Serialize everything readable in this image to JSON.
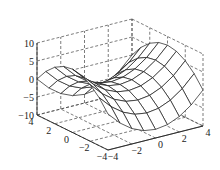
{
  "chart_data": {
    "type": "surface",
    "title": "",
    "xlabel": "",
    "ylabel": "",
    "zlabel": "",
    "function": "z = (x^2 - y^2) / 2",
    "x_range": [
      -4,
      4
    ],
    "y_range": [
      -4,
      4
    ],
    "zlim": [
      -10,
      10
    ],
    "grid": true,
    "grid_style": "dashed",
    "mesh_steps": 8,
    "x_ticks": [
      "-4",
      "-2",
      "0",
      "2",
      "4"
    ],
    "y_ticks": [
      "4",
      "2",
      "0",
      "-2",
      "-4"
    ],
    "z_ticks": [
      "-10",
      "-5",
      "0",
      "5",
      "10"
    ],
    "colors": {
      "mesh": "#1a1a1a",
      "grid": "#444444",
      "face": "#ffffff"
    }
  }
}
